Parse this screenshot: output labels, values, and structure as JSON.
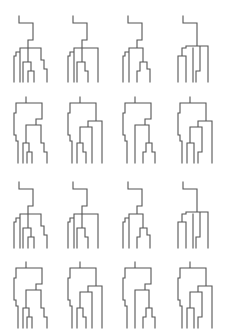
{
  "figure": {
    "background": "#ffffff",
    "stroke_color": "#555555",
    "grid": {
      "rows": 4,
      "cols": 4
    },
    "col_x": [
      14,
      68,
      123,
      178
    ],
    "row_y": [
      16,
      97,
      182,
      262
    ],
    "shapes": {
      "A1": "M5 0 L5 7 L19 7 L19 24 L14 24 L14 32 M2 40 L2 36 L6 36 L6 32 L27 32 L27 44 L30 44 L30 53 L33 53 L33 66 M2 40 L0 40 L0 66 M6 36 L6 66 M14 32 L14 46 L9 46 L9 66 M14 46 L17 46 L17 55 L20 55 L20 66 M17 55 L14 55 L14 66",
      "A2": "M5 0 L5 7 L19 7 L19 24 L14 24 L14 32 M2 40 L2 36 L6 36 L6 32 L30 32 L30 66 M2 40 L0 40 L0 66 M6 36 L6 66 M14 32 L14 46 L9 46 L9 66 M14 46 L17 46 L17 55 L20 55 L20 66",
      "A3": "M5 0 L5 7 L19 7 L19 24 L14 24 L14 32 M2 40 L2 36 L6 36 L6 32 L20 32 L20 46 L24 46 L24 53 L27 53 L27 66 M2 40 L0 40 L0 66 M6 36 L6 66 M20 46 L17 46 L17 55 L14 55 L14 66 M6 46 L6 55",
      "A4": "M5 0 L5 7 L19 7 L19 24 M8 32 L8 30 L30 30 L30 66 M8 32 L4 32 L4 40 L0 40 L0 66 M4 40 L8 40 L8 66 M19 24 L19 30 M22 30 L22 55 L18 55 L18 66 M15 32 L15 66",
      "B1": "M12 0 L12 6 M2 6 L28 6 L28 22 L22 22 L22 28 M2 6 L2 16 L0 16 L0 38 L2 38 L2 44 L4 44 L4 66 M22 28 L12 28 L12 46 L9 46 L9 66 M22 28 L27 28 L27 46 L30 46 L30 55 L33 55 L33 66 M12 46 L15 46 L15 55 L18 55 L18 66 M15 55 L13 55 L13 66",
      "B2": "M12 0 L12 6 M2 6 L28 6 L28 24 L20 24 L20 30 M2 6 L2 16 L0 16 L0 38 L2 38 L2 44 L4 44 L4 66 M20 24 L34 24 L34 66 M20 30 L12 30 L12 46 L9 46 L9 66 M12 46 L15 46 L15 55 L18 55 L18 66 M20 30 L24 30 L24 66",
      "B3": "M12 0 L12 6 M2 6 L28 6 L28 22 L22 22 L22 28 M2 6 L2 16 L0 16 L0 38 L2 38 L2 44 L4 44 L4 66 M22 28 L12 28 L12 66 M22 28 L26 28 L26 46 L23 46 L23 55 L20 55 L20 66 M26 46 L29 46 L29 55 L32 55 L32 66",
      "B4": "M12 0 L12 6 M2 6 L28 6 L28 24 L20 24 M2 6 L2 16 L0 16 L0 38 L2 38 L2 44 L4 44 L4 66 M20 24 L34 24 L34 66 M20 24 L20 30 L12 30 L12 46 L9 46 L9 66 M20 30 L24 30 L24 55 L20 55 L20 66 M12 46 L16 46 L16 66"
    },
    "cells": [
      {
        "row": 0,
        "col": 0,
        "shape": "A1"
      },
      {
        "row": 0,
        "col": 1,
        "shape": "A2"
      },
      {
        "row": 0,
        "col": 2,
        "shape": "A3"
      },
      {
        "row": 0,
        "col": 3,
        "shape": "A4"
      },
      {
        "row": 1,
        "col": 0,
        "shape": "B1"
      },
      {
        "row": 1,
        "col": 1,
        "shape": "B2"
      },
      {
        "row": 1,
        "col": 2,
        "shape": "B3"
      },
      {
        "row": 1,
        "col": 3,
        "shape": "B4"
      },
      {
        "row": 2,
        "col": 0,
        "shape": "A1"
      },
      {
        "row": 2,
        "col": 1,
        "shape": "A2"
      },
      {
        "row": 2,
        "col": 2,
        "shape": "A3"
      },
      {
        "row": 2,
        "col": 3,
        "shape": "A4"
      },
      {
        "row": 3,
        "col": 0,
        "shape": "B1"
      },
      {
        "row": 3,
        "col": 1,
        "shape": "B2"
      },
      {
        "row": 3,
        "col": 2,
        "shape": "B3"
      },
      {
        "row": 3,
        "col": 3,
        "shape": "B4"
      }
    ]
  }
}
